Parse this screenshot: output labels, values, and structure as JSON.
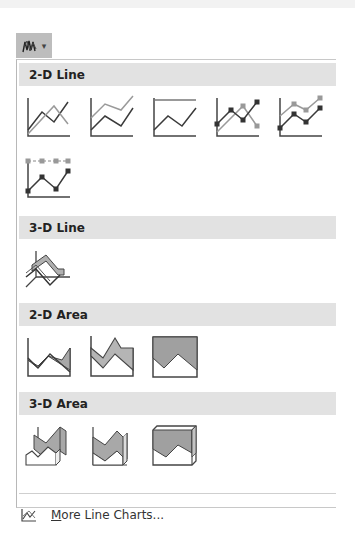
{
  "ribbon": {
    "button_icon": "line-chart-icon",
    "dropdown_icon": "chevron-down-icon",
    "dropdown_glyph": "▾"
  },
  "gallery": {
    "sections": [
      {
        "title": "2-D Line",
        "items": [
          {
            "name": "line",
            "icon": "line-chart-icon"
          },
          {
            "name": "stacked-line",
            "icon": "stacked-line-chart-icon"
          },
          {
            "name": "100-stacked-line",
            "icon": "100-stacked-line-chart-icon"
          },
          {
            "name": "line-with-markers",
            "icon": "line-markers-chart-icon"
          },
          {
            "name": "stacked-line-with-markers",
            "icon": "stacked-line-markers-chart-icon"
          },
          {
            "name": "100-stacked-line-with-markers",
            "icon": "100-stacked-line-markers-chart-icon"
          }
        ]
      },
      {
        "title": "3-D Line",
        "items": [
          {
            "name": "3d-line",
            "icon": "3d-line-chart-icon"
          }
        ]
      },
      {
        "title": "2-D Area",
        "items": [
          {
            "name": "area",
            "icon": "area-chart-icon"
          },
          {
            "name": "stacked-area",
            "icon": "stacked-area-chart-icon"
          },
          {
            "name": "100-stacked-area",
            "icon": "100-stacked-area-chart-icon"
          }
        ]
      },
      {
        "title": "3-D Area",
        "items": [
          {
            "name": "3d-area",
            "icon": "3d-area-chart-icon"
          },
          {
            "name": "3d-stacked-area",
            "icon": "3d-stacked-area-chart-icon"
          },
          {
            "name": "3d-100-stacked-area",
            "icon": "3d-100-stacked-area-chart-icon"
          }
        ]
      }
    ]
  },
  "footer": {
    "more_prefix": "M",
    "more_rest": "ore Line Charts...",
    "more_icon": "line-chart-icon"
  },
  "colors": {
    "dark_line": "#3a3a3a",
    "light_line": "#9a9a9a",
    "area_fill": "#a8a8a8",
    "header_bg": "#e2e2e2"
  }
}
